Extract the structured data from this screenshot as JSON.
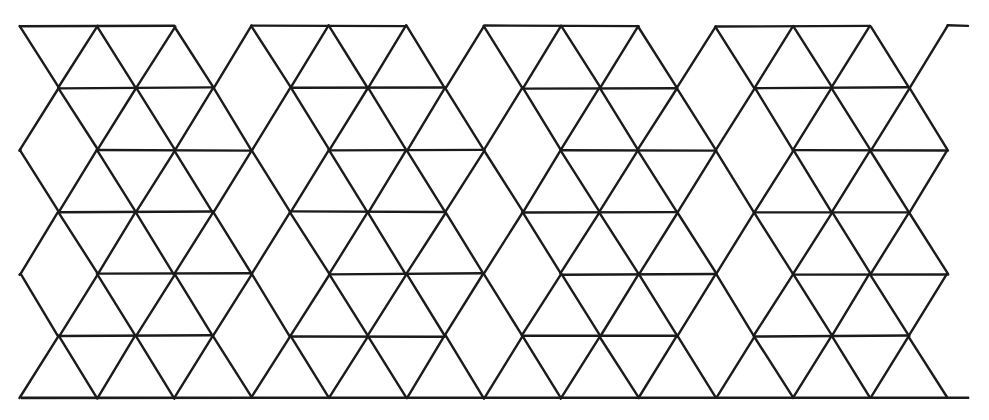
{
  "figure": {
    "kind": "rhombille-tiling",
    "canvas": {
      "width": 989,
      "height": 420
    },
    "colors": {
      "background": "#ffffff",
      "stroke": "#1b1b1b",
      "face": "#ffffff"
    },
    "stroke_width": 2.4
  },
  "lattice": {
    "origin_x": 20,
    "origin_y": 26,
    "column_pitch": 77.3,
    "row_pitch": 62.0,
    "columns": 13,
    "rows": 7,
    "row_y": [
      26,
      88,
      150,
      212,
      274,
      336,
      398
    ],
    "node_x_even": [
      20,
      97,
      174,
      251,
      328,
      406,
      483,
      560,
      637,
      714,
      791,
      869,
      946
    ],
    "node_x_odd": [
      58,
      135,
      212,
      290,
      367,
      444,
      521,
      598,
      675,
      753,
      830,
      907,
      984
    ]
  },
  "geometry": {
    "horizontal_run": 154.6,
    "diagonal_dx": 38.65,
    "diagonal_dy": 62,
    "rhombus_short_diagonal": 77.3,
    "rhombus_long_diagonal": 124,
    "interior_angles_deg": [
      60,
      120,
      60,
      120
    ],
    "hex_group_width": 232,
    "hex_group_height": 248
  },
  "extents": {
    "top_edge_y": 26,
    "bottom_edge_y": 398,
    "left_point_x": 20,
    "right_point_x": 968,
    "baseline_start_x": 22,
    "baseline_end_x": 968
  },
  "features": {
    "top_border": "zigzag of trapezoid tops with notched apex points",
    "bottom_border": "straight horizontal baseline with a row of alternating triangles above it",
    "left_border": "zigzag chevron profile terminating at a single left point",
    "right_border": "rhombus tips projecting to a single right point",
    "cube_groups_across": 4,
    "cube_groups_down": 3
  },
  "labels": {
    "figure_caption": "",
    "axis_labels": [],
    "legend": []
  }
}
